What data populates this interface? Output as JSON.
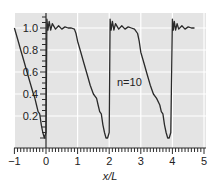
{
  "chart_data": {
    "type": "line",
    "title": "",
    "xlabel": "x/L",
    "ylabel": "",
    "xlim": [
      -1,
      5
    ],
    "ylim": [
      0,
      1.1
    ],
    "grid": true,
    "legend": null,
    "x_ticks": [
      "−1",
      "0",
      "1",
      "2",
      "3",
      "4",
      "5"
    ],
    "y_ticks": [
      "0.2",
      "0.4",
      "0.6",
      "0.8",
      "1.0"
    ],
    "annotations": [
      {
        "text": "n=10",
        "x": 2.4,
        "y": 0.5
      }
    ],
    "series": [
      {
        "name": "n=10 Fourier partial sum",
        "x": [
          -1.0,
          -0.9,
          -0.8,
          -0.7,
          -0.6,
          -0.5,
          -0.4,
          -0.35,
          -0.3,
          -0.25,
          -0.2,
          -0.15,
          -0.1,
          -0.05,
          0.0,
          0.03,
          0.06,
          0.1,
          0.15,
          0.2,
          0.3,
          0.4,
          0.5,
          0.6,
          0.7,
          0.8,
          0.9,
          0.95,
          1.0,
          1.1,
          1.2,
          1.3,
          1.4,
          1.5,
          1.6,
          1.65,
          1.7,
          1.75,
          1.8,
          1.85,
          1.9,
          1.95,
          2.0,
          2.03,
          2.06,
          2.1,
          2.15,
          2.2,
          2.3,
          2.4,
          2.5,
          2.6,
          2.7,
          2.8,
          2.9,
          2.95,
          3.0,
          3.1,
          3.2,
          3.3,
          3.4,
          3.5,
          3.6,
          3.65,
          3.7,
          3.75,
          3.8,
          3.85,
          3.9,
          3.95,
          4.0,
          4.03,
          4.06,
          4.1,
          4.15,
          4.2,
          4.3,
          4.4,
          4.5,
          4.6,
          4.7
        ],
        "y": [
          1.0,
          0.9,
          0.8,
          0.7,
          0.6,
          0.5,
          0.4,
          0.36,
          0.3,
          0.24,
          0.22,
          0.12,
          0.05,
          0.0,
          0.05,
          1.08,
          0.98,
          1.06,
          0.98,
          1.04,
          0.99,
          1.02,
          0.99,
          1.01,
          1.0,
          1.0,
          0.99,
          0.95,
          0.88,
          0.78,
          0.68,
          0.58,
          0.48,
          0.4,
          0.36,
          0.3,
          0.24,
          0.22,
          0.12,
          0.05,
          0.0,
          0.0,
          0.05,
          1.08,
          0.98,
          1.06,
          0.98,
          1.04,
          0.99,
          1.02,
          0.99,
          1.01,
          1.0,
          0.99,
          0.95,
          0.88,
          0.78,
          0.68,
          0.58,
          0.48,
          0.4,
          0.36,
          0.3,
          0.24,
          0.22,
          0.12,
          0.05,
          0.0,
          0.0,
          0.05,
          1.08,
          0.98,
          1.06,
          0.98,
          1.04,
          0.99,
          1.02,
          0.99,
          1.01,
          1.0,
          1.0
        ]
      }
    ]
  },
  "axes": {
    "xlabel": "x/L",
    "annotation": "n=10"
  }
}
